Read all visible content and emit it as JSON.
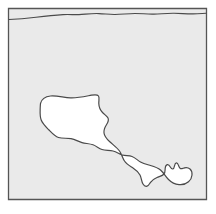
{
  "figure": {
    "kind": "region-outline-map",
    "title": "",
    "canvas": {
      "width": 216,
      "height": 214
    },
    "page_background": "#ffffff",
    "frame": {
      "name": "map-frame",
      "x": 8.5,
      "y": 8.5,
      "width": 198,
      "height": 191,
      "fill": "#eaeaea",
      "stroke": "#555555",
      "stroke_width": 1.3
    },
    "shoreline": {
      "name": "top-wavy-line",
      "stroke": "#4a4a4a",
      "stroke_width": 1.1,
      "fill": "none",
      "description": "thin undulating line running left to right just below the top frame edge",
      "path": "M 9 19.5 C 18 19.2 27 18.4 36 17.3 C 45 16.2 54 15.2 63 14.6 C 70 14.2 74 14.9 79 14.6 C 86 14.2 92 13.3 99 13.6 C 105 13.8 109 14.6 115 14.5 C 122 14.4 128 13.5 135 13.5 C 142 13.5 147 14.3 154 14.1 C 161 13.9 167 13.2 174 13.3 C 181 13.4 187 14.0 193 13.9 C 199 13.8 203 13.4 206 13.3"
    },
    "region": {
      "name": "white-region-outline",
      "fill": "#ffffff",
      "stroke": "#4a4a4a",
      "stroke_width": 1.2,
      "description": "large irregular white area in the lower centre, a broad rounded body on the left joined by a narrow neck to a smaller hooked lobe on the right, with a short tail dipping downward between them",
      "path": "M 40.5 103.5 C 41.5 99.5 45.5 96.5 50.5 96.0 C 57.0 95.4 63.5 97.5 70.5 97.8 C 78.0 98.1 85.5 96.3 91.5 95.2 C 95.0 94.6 97.5 94.6 98.5 96.0 C 99.6 97.6 98.7 100.5 98.8 103.5 C 98.9 107.0 100.2 110.0 102.5 112.5 C 104.6 114.8 107.0 116.0 108.0 118.0 C 109.0 120.1 108.0 122.3 106.6 124.5 C 105.0 127.0 103.6 129.8 104.0 133.0 C 104.4 136.4 106.8 139.0 109.5 141.5 C 113.0 144.8 117.0 147.5 119.5 151.0 C 121.8 154.2 122.5 158.0 124.5 161.0 C 126.6 164.2 130.0 166.0 133.0 168.0 C 136.0 170.0 138.5 172.0 140.0 175.0 C 141.5 178.0 141.5 181.5 143.0 184.0 C 144.0 185.7 145.5 186.6 147.0 186.2 C 148.6 185.8 149.3 184.0 150.5 182.3 C 152.2 180.0 154.5 178.6 157.0 177.5 C 159.8 176.3 162.5 175.8 164.0 174.0 C 165.3 172.4 165.0 170.2 165.2 168.3 C 165.4 166.5 166.2 165.0 167.3 164.7 C 168.5 164.4 169.5 165.6 170.3 167.0 C 171.0 168.2 171.8 169.2 172.8 169.0 C 173.9 168.8 174.2 167.3 174.5 165.8 C 174.8 164.3 175.3 163.0 176.3 162.9 C 177.3 162.8 178.0 164.0 178.5 165.4 C 179.0 166.8 179.4 168.2 180.5 168.6 C 181.8 169.1 183.0 168.2 184.5 167.8 C 186.5 167.3 188.5 167.7 190.0 169.0 C 191.6 170.4 192.2 172.6 192.0 175.0 C 191.8 177.5 190.6 180.0 188.5 181.8 C 186.0 184.0 182.5 185.0 179.0 184.6 C 175.0 184.2 171.3 182.3 168.5 179.5 C 165.5 176.5 163.6 172.6 160.5 170.0 C 157.6 167.6 154.0 166.5 150.5 165.5 C 147.0 164.5 143.5 163.7 140.5 162.0 C 137.5 160.3 135.2 157.7 132.0 156.5 C 129.0 155.4 125.5 155.9 122.5 155.0 C 119.3 154.0 116.5 151.8 113.0 151.0 C 109.3 150.1 105.3 150.6 102.0 149.5 C 98.8 148.4 96.3 146.0 93.0 144.8 C 89.5 143.5 85.5 143.6 82.0 142.6 C 78.3 141.5 75.0 139.3 71.0 138.6 C 66.8 137.9 62.2 138.7 58.5 137.5 C 54.8 136.3 52.0 133.1 49.0 130.0 C 46.0 126.9 42.8 124.0 41.2 120.0 C 39.7 116.2 40.1 112.0 40.2 108.0 C 40.3 106.3 40.3 104.8 40.5 103.5 Z"
    },
    "region_outline_alt": {
      "name": "region-boundary",
      "description": "boundary rendered as closed outline of the white area",
      "path": "M 40.8 104.0 C 41.0 99.0 45.5 95.8 51.5 95.5 C 58.5 95.1 65.5 97.6 72.5 97.8 C 80.0 98.0 87.0 96.0 92.5 95.0 C 96.0 94.4 98.2 95.0 98.7 97.3 C 99.2 99.6 98.4 102.3 98.7 105.0 C 99.1 108.6 101.0 111.4 103.4 113.8 C 105.6 116.0 108.0 117.4 108.6 119.6 C 109.2 121.9 107.8 124.0 106.3 126.3 C 104.7 128.8 103.6 131.6 104.3 134.6 C 105.0 137.7 107.6 140.0 110.4 142.3 C 114.0 145.3 118.0 147.9 120.3 151.4 C 122.4 154.7 122.8 158.7 124.9 161.8 C 127.0 165.0 130.4 166.8 133.3 169.0 C 136.2 171.2 138.5 173.6 139.7 176.8 C 140.8 179.8 140.7 183.3 142.0 186.3 C 142.9 188.4 144.4 189.8 146.3 189.6 C 148.3 189.4 149.5 187.6 150.8 185.6 C 152.5 183.0 154.6 181.1 157.3 179.7 C 160.2 178.2 163.2 177.5 164.8 175.4 C 166.2 173.5 165.9 171.0 166.1 168.9 C 166.3 167.0 167.0 165.6 168.0 165.4 C 169.1 165.2 170.0 166.3 170.8 167.5 C 171.6 168.7 172.4 169.7 173.4 169.5 C 174.5 169.3 174.9 167.8 175.2 166.3 C 175.5 164.8 176.0 163.5 177.0 163.4 C 178.0 163.3 178.7 164.5 179.2 165.9 C 179.7 167.3 180.1 168.7 181.2 169.1 C 182.5 169.6 183.7 168.7 185.2 168.3 C 187.2 167.8 189.2 168.2 190.7 169.5"
    }
  }
}
